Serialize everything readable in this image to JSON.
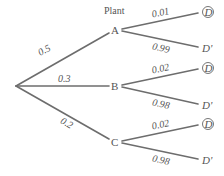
{
  "diagram": {
    "type": "probability-tree",
    "header": "Plant",
    "root": {
      "x": 16,
      "y": 86
    },
    "branches": [
      {
        "node": "A",
        "prob": "0.5",
        "x": 115,
        "y": 30,
        "children": [
          {
            "label": "D",
            "circled": true,
            "prob": "0.01",
            "x": 204,
            "y": 12
          },
          {
            "label": "D'",
            "circled": false,
            "prob": "0.99",
            "x": 204,
            "y": 48
          }
        ]
      },
      {
        "node": "B",
        "prob": "0.3",
        "x": 115,
        "y": 86,
        "children": [
          {
            "label": "D",
            "circled": true,
            "prob": "0.02",
            "x": 204,
            "y": 68
          },
          {
            "label": "D'",
            "circled": false,
            "prob": "0.98",
            "x": 204,
            "y": 105
          }
        ]
      },
      {
        "node": "C",
        "prob": "0.2",
        "x": 115,
        "y": 142,
        "children": [
          {
            "label": "D",
            "circled": true,
            "prob": "0.02",
            "x": 204,
            "y": 124
          },
          {
            "label": "D'",
            "circled": false,
            "prob": "0.98",
            "x": 204,
            "y": 160
          }
        ]
      }
    ]
  }
}
